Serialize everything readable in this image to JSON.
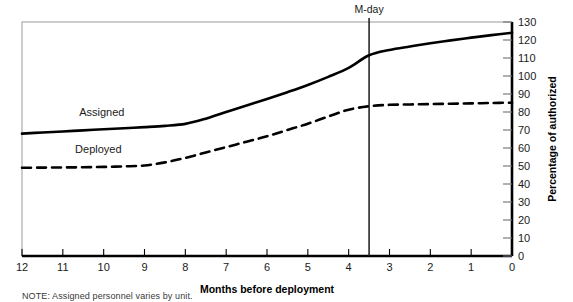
{
  "chart_data": {
    "type": "line",
    "title": "",
    "xlabel": "Months before deployment",
    "ylabel": "Percentage of authorized",
    "xlim": [
      12,
      0
    ],
    "ylim": [
      0,
      130
    ],
    "x_ticks": [
      12,
      11,
      10,
      9,
      8,
      7,
      6,
      5,
      4,
      3,
      2,
      1,
      0
    ],
    "x_tick_labels": [
      "12",
      "11",
      "10",
      "9",
      "8",
      "7",
      "6",
      "5",
      "4",
      "3",
      "2",
      "1",
      "0"
    ],
    "y_ticks": [
      0,
      10,
      20,
      30,
      40,
      50,
      60,
      70,
      80,
      90,
      100,
      110,
      120,
      130
    ],
    "y_tick_labels": [
      "0",
      "10",
      "20",
      "30",
      "40",
      "50",
      "60",
      "70",
      "80",
      "90",
      "100",
      "110",
      "120",
      "130"
    ],
    "y_axis_position": "right",
    "grid": false,
    "legend": "inline-labels",
    "series": [
      {
        "name": "Assigned",
        "style": "solid",
        "color": "#000000",
        "label_x": 10.6,
        "label_y": 78,
        "x": [
          12,
          11.5,
          11,
          10.5,
          10,
          9.5,
          9,
          8.5,
          8,
          7.5,
          7,
          6.5,
          6,
          5.5,
          5,
          4.5,
          4,
          3.5,
          3,
          2.5,
          2,
          1.5,
          1,
          0.5,
          0
        ],
        "values": [
          68,
          68.6,
          69.2,
          69.8,
          70.4,
          71.0,
          71.6,
          72.3,
          73.4,
          76.3,
          80.0,
          83.6,
          87.2,
          91.0,
          95.0,
          99.5,
          104.5,
          111.5,
          114.5,
          116.4,
          118.2,
          119.8,
          121.3,
          122.7,
          124.0
        ]
      },
      {
        "name": "Deployed",
        "style": "dashed",
        "color": "#000000",
        "label_x": 10.7,
        "label_y": 57,
        "x": [
          12,
          11.5,
          11,
          10.5,
          10,
          9.5,
          9,
          8.5,
          8,
          7.5,
          7,
          6.5,
          6,
          5.5,
          5,
          4.5,
          4,
          3.5,
          3,
          2.5,
          2,
          1.5,
          1,
          0.5,
          0
        ],
        "values": [
          49.0,
          49.1,
          49.2,
          49.3,
          49.5,
          49.8,
          50.3,
          52.0,
          54.5,
          57.5,
          60.5,
          63.5,
          66.5,
          70.0,
          73.5,
          77.5,
          81.3,
          83.2,
          84.0,
          84.2,
          84.4,
          84.6,
          84.8,
          85.0,
          85.2
        ]
      }
    ],
    "annotations": [
      {
        "name": "m-day-marker",
        "label": "M-day",
        "x": 3.5,
        "type": "vertical-line"
      }
    ]
  },
  "note": {
    "text": "NOTE: Assigned personnel varies by unit."
  }
}
